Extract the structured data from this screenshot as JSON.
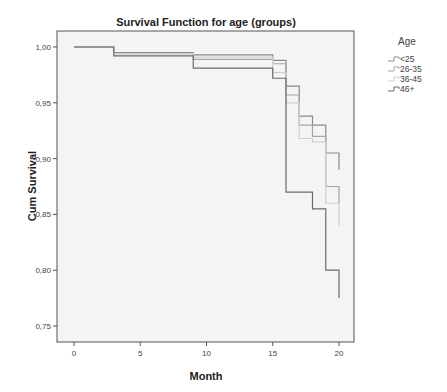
{
  "chart_data": {
    "type": "line",
    "subtype": "step (Kaplan-Meier survival)",
    "title": "Survival Function for age (groups)",
    "xlabel": "Month",
    "ylabel": "Cum Survival",
    "xlim": [
      -1,
      21
    ],
    "ylim": [
      0.74,
      1.015
    ],
    "x_ticks": [
      "0",
      "5",
      "10",
      "15",
      "20"
    ],
    "y_ticks": [
      "1,00",
      "0,95",
      "0,90",
      "0,85",
      "0,80",
      "0,75"
    ],
    "grid": false,
    "legend": {
      "title": "Age",
      "position": "right-top"
    },
    "series": [
      {
        "name": "<25",
        "color": "#8a8a8a",
        "points": [
          [
            0,
            1.0
          ],
          [
            3,
            0.995
          ],
          [
            9,
            0.993
          ],
          [
            15,
            0.988
          ],
          [
            16,
            0.965
          ],
          [
            17,
            0.938
          ],
          [
            18,
            0.93
          ],
          [
            19,
            0.905
          ],
          [
            20,
            0.89
          ]
        ]
      },
      {
        "name": "26-35",
        "color": "#a5a5a5",
        "points": [
          [
            0,
            1.0
          ],
          [
            3,
            0.994
          ],
          [
            9,
            0.989
          ],
          [
            15,
            0.985
          ],
          [
            16,
            0.957
          ],
          [
            17,
            0.93
          ],
          [
            18,
            0.92
          ],
          [
            19,
            0.875
          ],
          [
            20,
            0.86
          ]
        ]
      },
      {
        "name": "36-45",
        "color": "#cfcfcf",
        "points": [
          [
            0,
            1.0
          ],
          [
            3,
            0.994
          ],
          [
            9,
            0.991
          ],
          [
            15,
            0.977
          ],
          [
            16,
            0.95
          ],
          [
            17,
            0.918
          ],
          [
            18,
            0.915
          ],
          [
            19,
            0.86
          ],
          [
            20,
            0.84
          ]
        ]
      },
      {
        "name": "46+",
        "color": "#6a6a6a",
        "points": [
          [
            0,
            1.0
          ],
          [
            3,
            0.992
          ],
          [
            9,
            0.981
          ],
          [
            15,
            0.972
          ],
          [
            16,
            0.87
          ],
          [
            17,
            0.87
          ],
          [
            18,
            0.855
          ],
          [
            19,
            0.8
          ],
          [
            20,
            0.775
          ]
        ]
      }
    ]
  },
  "legend": {
    "title": "Age",
    "items": [
      "<25",
      "26-35",
      "36-45",
      "46+"
    ]
  }
}
